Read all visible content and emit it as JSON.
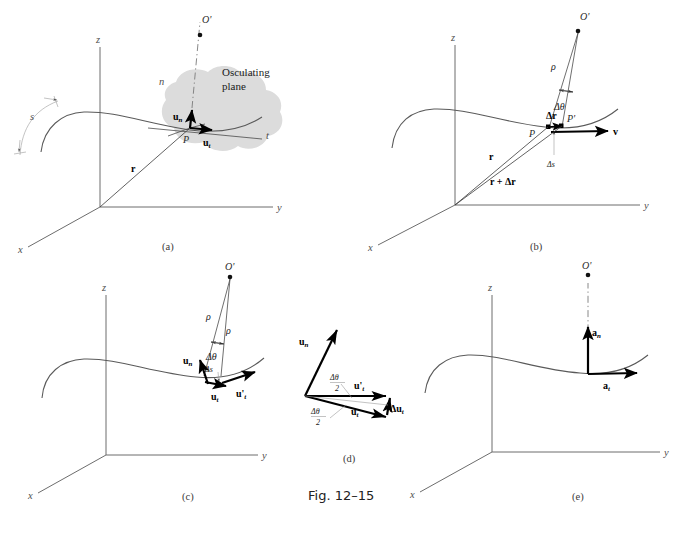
{
  "figure": {
    "caption": "Fig. 12–15",
    "background_color": "#ffffff",
    "osculating_plane_color": "#dcdcdc",
    "axis_color": "#6d6d6d",
    "vector_color": "#000000"
  },
  "panels": [
    {
      "id": "a",
      "label": "(a)",
      "axes": {
        "x": "x",
        "y": "y",
        "z": "z"
      },
      "labels": {
        "center_of_curvature": "O'",
        "point": "P",
        "normal_axis": "n",
        "tangent_axis": "t",
        "unit_normal": "u",
        "unit_normal_sub": "n",
        "unit_tangent": "u",
        "unit_tangent_sub": "t",
        "position_vector": "r",
        "arc_length": "s",
        "plane_line1": "Osculating",
        "plane_line2": "plane"
      }
    },
    {
      "id": "b",
      "label": "(b)",
      "axes": {
        "x": "x",
        "y": "y",
        "z": "z"
      },
      "labels": {
        "center_of_curvature": "O'",
        "point": "P",
        "point_prime": "P'",
        "radius": "ρ",
        "delta_theta": "Δθ",
        "delta_r": "Δr",
        "delta_s": "Δs",
        "velocity": "v",
        "position_vector": "r",
        "position_vector_sum": "r + Δr"
      }
    },
    {
      "id": "c",
      "label": "(c)",
      "axes": {
        "x": "x",
        "y": "y",
        "z": "z"
      },
      "labels": {
        "center_of_curvature": "O'",
        "radius_1": "ρ",
        "radius_2": "ρ",
        "delta_theta": "Δθ",
        "delta_s": "Δs",
        "unit_normal": "u",
        "unit_normal_sub": "n",
        "unit_tangent": "u",
        "unit_tangent_sub": "t",
        "unit_tangent_prime": "u'",
        "unit_tangent_prime_sub": "t"
      }
    },
    {
      "id": "d",
      "label": "(d)",
      "labels": {
        "unit_normal": "u",
        "unit_normal_sub": "n",
        "unit_tangent": "u",
        "unit_tangent_sub": "t",
        "unit_tangent_prime": "u'",
        "unit_tangent_prime_sub": "t",
        "delta_u_t": "Δu",
        "delta_u_t_sub": "t",
        "half_angle_num": "Δθ",
        "half_angle_den": "2"
      }
    },
    {
      "id": "e",
      "label": "(e)",
      "axes": {
        "x": "x",
        "y": "y",
        "z": "z"
      },
      "labels": {
        "center_of_curvature": "O'",
        "accel_normal": "a",
        "accel_normal_sub": "n",
        "accel_tangent": "a",
        "accel_tangent_sub": "t"
      }
    }
  ]
}
